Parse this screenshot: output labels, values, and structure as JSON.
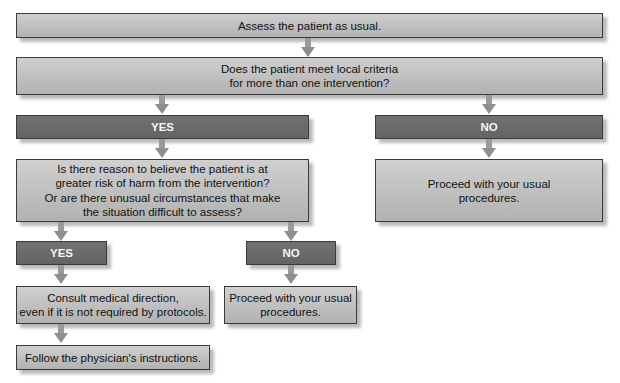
{
  "flowchart": {
    "assess": "Assess the patient as usual.",
    "criteria_question": [
      "Does the patient meet local criteria",
      "for more than one intervention?"
    ],
    "yes_1": "YES",
    "no_1": "NO",
    "risk_question": [
      "Is there reason to believe the patient is at",
      "greater risk of harm from the intervention?",
      "Or are there unusual circumstances that make",
      "the situation difficult to assess?"
    ],
    "proceed_right": [
      "Proceed with your usual",
      "procedures."
    ],
    "yes_2": "YES",
    "no_2": "NO",
    "consult": [
      "Consult medical direction,",
      "even if it is not required by protocols."
    ],
    "proceed_middle": [
      "Proceed with your usual",
      "procedures."
    ],
    "follow": "Follow the physician's instructions."
  },
  "colors": {
    "light_box": "#c2c2c2",
    "dark_box": "#6a6a6a",
    "arrow": "#9a9a9a",
    "border": "#3a3a3a"
  }
}
